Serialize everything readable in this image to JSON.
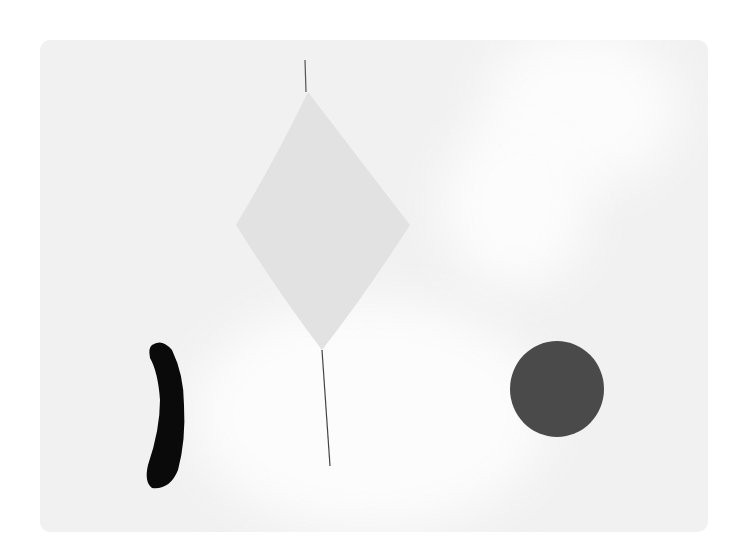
{
  "artwork": {
    "background": "#f1f1f1",
    "frame": "#ffffff",
    "shapes": [
      {
        "name": "diamond",
        "color": "#e2e2e2"
      },
      {
        "name": "thread-line",
        "color": "#444444"
      },
      {
        "name": "black-crescent",
        "color": "#0a0a0a"
      },
      {
        "name": "dark-circle",
        "color": "#4a4a4a"
      },
      {
        "name": "white-diagonal-band",
        "color": "#fdfdfd"
      }
    ]
  }
}
